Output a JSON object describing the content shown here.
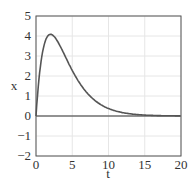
{
  "chart_data": {
    "type": "line",
    "title": "",
    "xlabel": "t",
    "ylabel": "x",
    "xlim": [
      0,
      20
    ],
    "ylim": [
      -2,
      5
    ],
    "xticks": [
      "0",
      "5",
      "10",
      "15",
      "20"
    ],
    "yticks": [
      "5",
      "4",
      "3",
      "2",
      "1",
      "0",
      "−1",
      "−2"
    ],
    "grid": true,
    "series": [
      {
        "name": "x(t)",
        "x": [
          0,
          0.5,
          1,
          1.5,
          2,
          2.5,
          3,
          4,
          5,
          6,
          7,
          8,
          9,
          10,
          12,
          14,
          16,
          18,
          20
        ],
        "values": [
          0,
          2.3,
          3.5,
          4.0,
          4.1,
          4.05,
          3.85,
          3.3,
          2.6,
          1.95,
          1.4,
          1.0,
          0.72,
          0.5,
          0.25,
          0.12,
          0.05,
          0.02,
          0.01
        ]
      },
      {
        "name": "zero",
        "x": [
          0,
          20
        ],
        "values": [
          0,
          0
        ]
      }
    ]
  }
}
